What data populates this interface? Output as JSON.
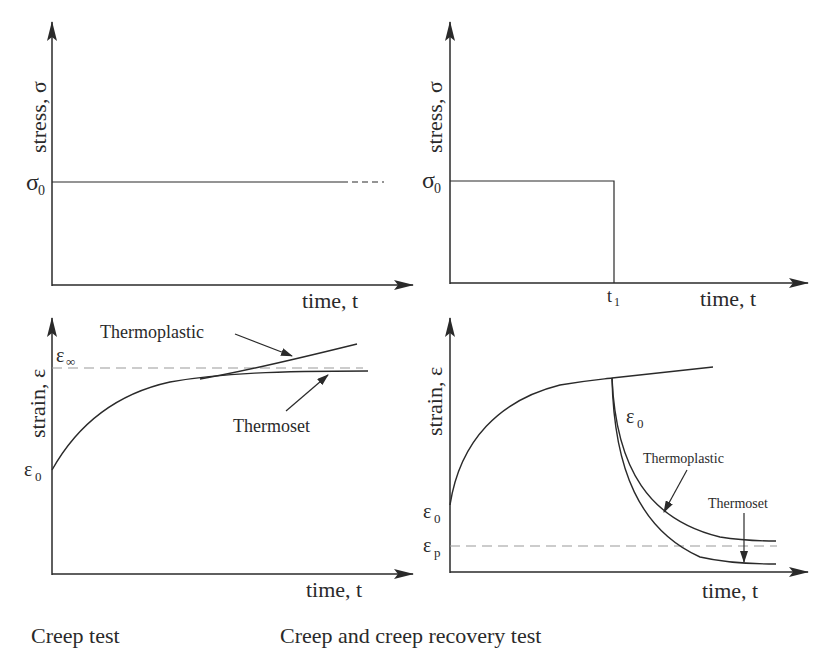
{
  "panels": {
    "creep_stress": {
      "ylabel": "stress, σ",
      "xlabel": "time, t",
      "level_label": "σ",
      "level_sub": "0"
    },
    "recovery_stress": {
      "ylabel": "stress, σ",
      "xlabel": "time, t",
      "level_label": "σ",
      "level_sub": "0",
      "t1_label": "t",
      "t1_sub": "1"
    },
    "creep_strain": {
      "ylabel": "strain, ε",
      "xlabel": "time, t",
      "einf_label": "ε",
      "einf_sub": "∞",
      "e0_label": "ε",
      "e0_sub": "0",
      "thermoplastic": "Thermoplastic",
      "thermoset": "Thermoset"
    },
    "recovery_strain": {
      "ylabel": "strain, ε",
      "xlabel": "time, t",
      "e0_label": "ε",
      "e0_sub": "0",
      "e0_drop_label": "ε",
      "e0_drop_sub": "0",
      "ep_label": "ε",
      "ep_sub": "p",
      "thermoplastic": "Thermoplastic",
      "thermoset": "Thermoset"
    }
  },
  "captions": {
    "left": "Creep test",
    "right": "Creep and creep recovery test"
  }
}
